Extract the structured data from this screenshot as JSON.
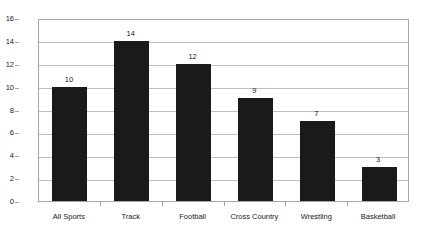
{
  "chart_data": {
    "type": "bar",
    "title": "",
    "subtitle": "",
    "xlabel": "",
    "ylabel": "",
    "categories": [
      "All Sports",
      "Track",
      "Football",
      "Cross Country",
      "Wrestling",
      "Basketball"
    ],
    "values": [
      10,
      14,
      12,
      9,
      7,
      3
    ],
    "value_labels": [
      "10",
      "14",
      "12",
      "9",
      "7",
      "3"
    ],
    "ylim": [
      0,
      16
    ],
    "ytick_step": 2,
    "ytick_labels": [
      "0",
      "2",
      "4",
      "6",
      "8",
      "10",
      "12",
      "14",
      "16"
    ],
    "ytick_values": [
      0,
      2,
      4,
      6,
      8,
      10,
      12,
      14,
      16
    ],
    "grid": true,
    "grid_axis": "y",
    "legend": false,
    "legend_position": "none",
    "annotations": [],
    "colors": {
      "bar": "#1a1a1a",
      "gridline": "#bfbfbf",
      "axis": "#a6a6a6",
      "text": "#1a1a1a",
      "background": "#ffffff",
      "plot_background": "#ffffff"
    }
  }
}
